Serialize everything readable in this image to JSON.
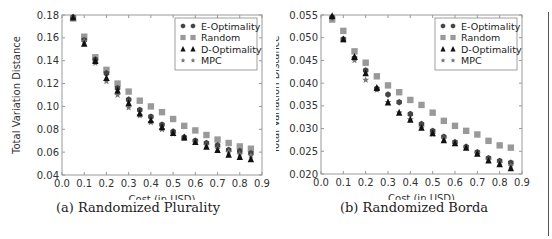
{
  "chart_data": [
    {
      "type": "scatter",
      "title": "",
      "caption": "(a) Randomized Plurality",
      "xlabel": "Cost (in USD)",
      "ylabel": "Total Variation Distance",
      "xlim": [
        0.0,
        0.9
      ],
      "ylim": [
        0.04,
        0.18
      ],
      "xticks": [
        "0.0",
        "0.1",
        "0.2",
        "0.3",
        "0.4",
        "0.5",
        "0.6",
        "0.7",
        "0.8",
        "0.9"
      ],
      "yticks": [
        "0.04",
        "0.06",
        "0.08",
        "0.10",
        "0.12",
        "0.14",
        "0.16",
        "0.18"
      ],
      "grid": false,
      "legend_position": "upper right",
      "x": [
        0.05,
        0.1,
        0.15,
        0.2,
        0.25,
        0.3,
        0.35,
        0.4,
        0.45,
        0.5,
        0.55,
        0.6,
        0.65,
        0.7,
        0.75,
        0.8,
        0.85
      ],
      "series": [
        {
          "name": "E-Optimality",
          "marker": "hexagon",
          "color": "#444444",
          "values": [
            0.178,
            0.158,
            0.141,
            0.129,
            0.116,
            0.106,
            0.097,
            0.091,
            0.084,
            0.078,
            0.073,
            0.07,
            0.068,
            0.066,
            0.062,
            0.061,
            0.059
          ]
        },
        {
          "name": "Random",
          "marker": "square",
          "color": "#999999",
          "values": [
            0.177,
            0.161,
            0.143,
            0.132,
            0.12,
            0.113,
            0.105,
            0.1,
            0.095,
            0.089,
            0.083,
            0.079,
            0.075,
            0.071,
            0.068,
            0.065,
            0.063
          ]
        },
        {
          "name": "D-Optimality",
          "marker": "triangle",
          "color": "#111111",
          "values": [
            0.178,
            0.155,
            0.14,
            0.125,
            0.114,
            0.103,
            0.094,
            0.088,
            0.082,
            0.077,
            0.073,
            0.069,
            0.065,
            0.062,
            0.058,
            0.056,
            0.054
          ]
        },
        {
          "name": "MPC",
          "marker": "star",
          "color": "#777777",
          "values": [
            0.178,
            0.157,
            0.138,
            0.122,
            0.11,
            0.099,
            0.092,
            0.086,
            0.08,
            0.076,
            0.072,
            0.069,
            0.066,
            0.063,
            0.06,
            0.058,
            0.057
          ]
        }
      ]
    },
    {
      "type": "scatter",
      "title": "",
      "caption": "(b) Randomized Borda",
      "xlabel": "Cost (in USD)",
      "ylabel": "Total Variation Distance",
      "xlim": [
        0.0,
        0.9
      ],
      "ylim": [
        0.02,
        0.055
      ],
      "xticks": [
        "0.0",
        "0.1",
        "0.2",
        "0.3",
        "0.4",
        "0.5",
        "0.6",
        "0.7",
        "0.8",
        "0.9"
      ],
      "yticks": [
        "0.020",
        "0.025",
        "0.030",
        "0.035",
        "0.040",
        "0.045",
        "0.050",
        "0.055"
      ],
      "grid": false,
      "legend_position": "upper right",
      "x": [
        0.05,
        0.1,
        0.15,
        0.2,
        0.25,
        0.3,
        0.35,
        0.4,
        0.45,
        0.5,
        0.55,
        0.6,
        0.65,
        0.7,
        0.75,
        0.8,
        0.85
      ],
      "series": [
        {
          "name": "E-Optimality",
          "marker": "hexagon",
          "color": "#444444",
          "values": [
            0.0545,
            0.0497,
            0.0455,
            0.0428,
            0.0388,
            0.0375,
            0.0358,
            0.0332,
            0.031,
            0.0295,
            0.0282,
            0.027,
            0.026,
            0.0248,
            0.0235,
            0.0229,
            0.0225
          ]
        },
        {
          "name": "Random",
          "marker": "square",
          "color": "#999999",
          "values": [
            0.054,
            0.0515,
            0.047,
            0.0445,
            0.0415,
            0.0395,
            0.038,
            0.0363,
            0.0352,
            0.0335,
            0.0317,
            0.0306,
            0.0295,
            0.0287,
            0.0273,
            0.0263,
            0.0258
          ]
        },
        {
          "name": "D-Optimality",
          "marker": "triangle",
          "color": "#111111",
          "values": [
            0.0548,
            0.0497,
            0.0458,
            0.0422,
            0.039,
            0.0358,
            0.0335,
            0.032,
            0.0302,
            0.029,
            0.0275,
            0.0268,
            0.0258,
            0.0245,
            0.023,
            0.0222,
            0.0213
          ]
        },
        {
          "name": "MPC",
          "marker": "star",
          "color": "#777777",
          "values": [
            0.0545,
            0.0495,
            0.045,
            0.0407,
            0.0385,
            0.0358,
            0.0335,
            0.032,
            0.0302,
            0.0288,
            0.0278,
            0.0267,
            0.0258,
            0.0246,
            0.0231,
            0.0224,
            0.0218
          ]
        }
      ]
    }
  ]
}
